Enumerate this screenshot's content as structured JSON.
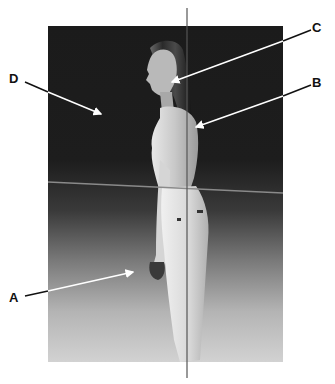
{
  "figure": {
    "type": "posture-reference-photo",
    "photo": {
      "x": 48,
      "y": 26,
      "width": 235,
      "height": 336,
      "bg_top": "#1b1b1b",
      "bg_bottom": "#d2d2d2"
    },
    "plumb_line": {
      "x": 187,
      "y1": 8,
      "y2": 378,
      "color": "#555555"
    },
    "horizontal_line": {
      "x1": 48,
      "y1": 182,
      "x2": 283,
      "y2": 193,
      "color": "#8a8a8a"
    }
  },
  "labels": [
    {
      "id": "A",
      "text": "A",
      "x": 9,
      "y": 291,
      "line": [
        25,
        296,
        133,
        272
      ],
      "arrow_color": "#ffffff"
    },
    {
      "id": "B",
      "text": "B",
      "x": 312,
      "y": 76,
      "line": [
        311,
        85,
        196,
        127
      ],
      "arrow_color": "#ffffff"
    },
    {
      "id": "C",
      "text": "C",
      "x": 312,
      "y": 21,
      "line": [
        311,
        30,
        172,
        82
      ],
      "arrow_color": "#ffffff"
    },
    {
      "id": "D",
      "text": "D",
      "x": 9,
      "y": 72,
      "line": [
        25,
        82,
        101,
        114
      ],
      "arrow_color": "#ffffff"
    }
  ]
}
